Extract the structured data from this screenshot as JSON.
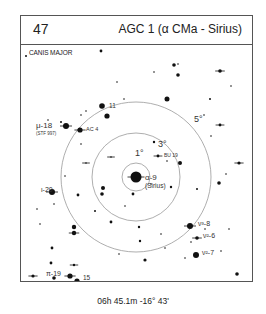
{
  "header": {
    "plate_number": "47",
    "title": "AGC 1 (α CMa - Sirius)"
  },
  "chart": {
    "constellation": "CANIS MAJOR",
    "center": {
      "x": 115,
      "y": 133
    },
    "rings": [
      {
        "radius": 14,
        "label": "1°",
        "lx": 114,
        "ly": 112
      },
      {
        "radius": 44,
        "label": "3°",
        "lx": 137,
        "ly": 103
      },
      {
        "radius": 75,
        "label": "5°",
        "lx": 173,
        "ly": 78
      }
    ],
    "labels": [
      {
        "text": "α-9",
        "x": 124,
        "y": 136,
        "size": 8
      },
      {
        "text": "(Sirius)",
        "x": 124,
        "y": 144,
        "size": 6.5
      },
      {
        "text": "11",
        "x": 88,
        "y": 64,
        "size": 6.5
      },
      {
        "text": "AC 4",
        "x": 65,
        "y": 87,
        "size": 5.5
      },
      {
        "text": "BU 19",
        "x": 143,
        "y": 113,
        "size": 5
      },
      {
        "text": "μ-18",
        "x": 15,
        "y": 84,
        "size": 8
      },
      {
        "text": "(STF 997)",
        "x": 15,
        "y": 91,
        "size": 4.5
      },
      {
        "text": "ι-20",
        "x": 20,
        "y": 148,
        "size": 7
      },
      {
        "text": "ν³-8",
        "x": 177,
        "y": 182,
        "size": 7
      },
      {
        "text": "ν²-6",
        "x": 182,
        "y": 194,
        "size": 7
      },
      {
        "text": "ν²-7",
        "x": 181,
        "y": 211,
        "size": 7
      },
      {
        "text": "π-19",
        "x": 25,
        "y": 232,
        "size": 7
      },
      {
        "text": "15",
        "x": 62,
        "y": 236,
        "size": 6.5
      },
      {
        "text": "17",
        "x": 47,
        "y": 245,
        "size": 6
      }
    ],
    "stars": [
      {
        "x": 115,
        "y": 133,
        "r": 5.5,
        "tick": true
      },
      {
        "x": 81,
        "y": 62,
        "r": 2.8
      },
      {
        "x": 86,
        "y": 72,
        "r": 2.6
      },
      {
        "x": 59,
        "y": 86,
        "r": 2.6,
        "tick": true
      },
      {
        "x": 137,
        "y": 112,
        "r": 1.4,
        "tick": true
      },
      {
        "x": 45,
        "y": 82,
        "r": 3,
        "tick": true
      },
      {
        "x": 31,
        "y": 148,
        "r": 3,
        "tick": true
      },
      {
        "x": 169,
        "y": 182,
        "r": 3,
        "tick": true
      },
      {
        "x": 176,
        "y": 194,
        "r": 1.8,
        "tick": true
      },
      {
        "x": 175,
        "y": 211,
        "r": 3
      },
      {
        "x": 49,
        "y": 232,
        "r": 2.6,
        "tick": true
      },
      {
        "x": 56,
        "y": 237,
        "r": 2.6
      },
      {
        "x": 47,
        "y": 242,
        "r": 1.8,
        "tick": true
      },
      {
        "x": 33,
        "y": 234,
        "r": 1.8
      },
      {
        "x": 30,
        "y": 219,
        "r": 1.4
      },
      {
        "x": 31,
        "y": 204,
        "r": 1.4
      },
      {
        "x": 53,
        "y": 221,
        "r": 1.2,
        "tick": true
      },
      {
        "x": 5,
        "y": 12,
        "r": 1
      },
      {
        "x": 80,
        "y": 7,
        "r": 1.4
      },
      {
        "x": 40,
        "y": 78,
        "r": 1
      },
      {
        "x": 27,
        "y": 76,
        "r": 0.8
      },
      {
        "x": 60,
        "y": 71,
        "r": 0.8
      },
      {
        "x": 65,
        "y": 67,
        "r": 0.8
      },
      {
        "x": 153,
        "y": 21,
        "r": 1.8
      },
      {
        "x": 157,
        "y": 31,
        "r": 1.8
      },
      {
        "x": 199,
        "y": 27,
        "r": 1.8,
        "tick": true
      },
      {
        "x": 146,
        "y": 55,
        "r": 2.5
      },
      {
        "x": 199,
        "y": 81,
        "r": 1.4,
        "tick": true
      },
      {
        "x": 198,
        "y": 139,
        "r": 1.8
      },
      {
        "x": 159,
        "y": 119,
        "r": 2
      },
      {
        "x": 112,
        "y": 150,
        "r": 1.4
      },
      {
        "x": 82,
        "y": 144,
        "r": 2
      },
      {
        "x": 81,
        "y": 150,
        "r": 1.8
      },
      {
        "x": 90,
        "y": 178,
        "r": 1.4
      },
      {
        "x": 57,
        "y": 151,
        "r": 1.4
      },
      {
        "x": 53,
        "y": 183,
        "r": 2.2
      },
      {
        "x": 53,
        "y": 189,
        "r": 2.2,
        "tick": true
      },
      {
        "x": 74,
        "y": 167,
        "r": 1
      },
      {
        "x": 118,
        "y": 183,
        "r": 1.2
      },
      {
        "x": 119,
        "y": 197,
        "r": 1.2
      },
      {
        "x": 124,
        "y": 216,
        "r": 1.6
      },
      {
        "x": 218,
        "y": 119,
        "r": 1.6,
        "tick": true
      },
      {
        "x": 133,
        "y": 98,
        "r": 1.2
      },
      {
        "x": 150,
        "y": 143,
        "r": 1.2
      },
      {
        "x": 189,
        "y": 55,
        "r": 1
      },
      {
        "x": 216,
        "y": 230,
        "r": 1.8
      },
      {
        "x": 130,
        "y": 140,
        "r": 0.8
      },
      {
        "x": 176,
        "y": 145,
        "r": 1
      },
      {
        "x": 210,
        "y": 42,
        "r": 0.8
      },
      {
        "x": 96,
        "y": 38,
        "r": 0.8
      },
      {
        "x": 124,
        "y": 244,
        "r": 1.2
      },
      {
        "x": 12,
        "y": 232,
        "r": 1.6,
        "tick": true
      },
      {
        "x": 205,
        "y": 130,
        "r": 0.8
      },
      {
        "x": 146,
        "y": 117,
        "r": 0.8
      },
      {
        "x": 183,
        "y": 71,
        "r": 0.8
      },
      {
        "x": 103,
        "y": 55,
        "r": 0.8
      },
      {
        "x": 133,
        "y": 28,
        "r": 0.8
      },
      {
        "x": 170,
        "y": 198,
        "r": 0.8
      },
      {
        "x": 164,
        "y": 214,
        "r": 0.8
      },
      {
        "x": 157,
        "y": 20,
        "r": 0.8
      },
      {
        "x": 190,
        "y": 92,
        "r": 0.8
      },
      {
        "x": 44,
        "y": 132,
        "r": 0.8
      },
      {
        "x": 33,
        "y": 160,
        "r": 0.8
      },
      {
        "x": 16,
        "y": 165,
        "r": 0.8
      },
      {
        "x": 19,
        "y": 180,
        "r": 0.8
      },
      {
        "x": 98,
        "y": 210,
        "r": 0.8
      },
      {
        "x": 104,
        "y": 162,
        "r": 0.8
      },
      {
        "x": 65,
        "y": 119,
        "r": 0.8,
        "tick": true
      },
      {
        "x": 90,
        "y": 113,
        "r": 0.8,
        "tick": true
      },
      {
        "x": 184,
        "y": 185,
        "r": 0.8
      },
      {
        "x": 60,
        "y": 100,
        "r": 0.8
      },
      {
        "x": 208,
        "y": 185,
        "r": 0.8
      },
      {
        "x": 200,
        "y": 207,
        "r": 0.8
      },
      {
        "x": 140,
        "y": 190,
        "r": 0.8
      },
      {
        "x": 144,
        "y": 204,
        "r": 0.8
      }
    ]
  },
  "footer": {
    "coordinates": "06h 45.1m  -16° 43'"
  }
}
